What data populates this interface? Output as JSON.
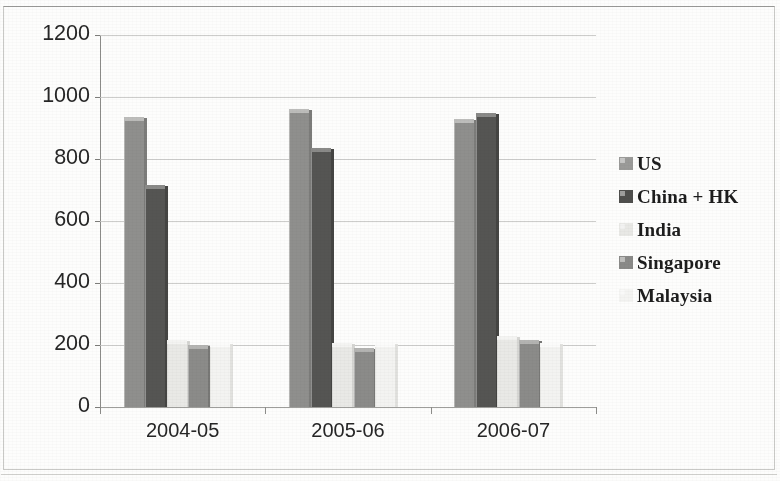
{
  "chart_data": {
    "type": "bar",
    "title": "",
    "xlabel": "",
    "ylabel": "",
    "categories": [
      "2004-05",
      "2005-06",
      "2006-07"
    ],
    "ylim": [
      0,
      1200
    ],
    "yticks": [
      0,
      200,
      400,
      600,
      800,
      1000,
      1200
    ],
    "ytick_labels": [
      "0",
      "200",
      "400",
      "600",
      "800",
      "1000",
      "1200"
    ],
    "grid": true,
    "legend_position": "right",
    "series": [
      {
        "name": "US",
        "color": "#8f8f8d",
        "values": [
          935,
          960,
          930
        ]
      },
      {
        "name": "China + HK",
        "color": "#555553",
        "values": [
          715,
          835,
          950
        ]
      },
      {
        "name": "India",
        "color": "#e9e9e6",
        "values": [
          215,
          205,
          230
        ]
      },
      {
        "name": "Singapore",
        "color": "#8b8b89",
        "values": [
          200,
          190,
          215
        ]
      },
      {
        "name": "Malaysia",
        "color": "#f3f3f1",
        "values": [
          205,
          205,
          205
        ]
      }
    ]
  },
  "legend": {
    "items": [
      {
        "label": "US"
      },
      {
        "label": "China + HK"
      },
      {
        "label": "India"
      },
      {
        "label": "Singapore"
      },
      {
        "label": "Malaysia"
      }
    ]
  }
}
